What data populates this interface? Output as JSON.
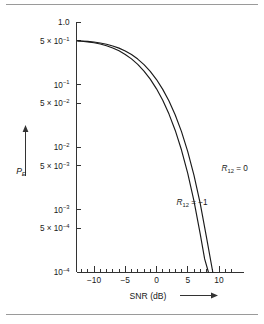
{
  "figure": {
    "has_top_rule": true,
    "has_bottom_rule": true,
    "background": "#ffffff",
    "ink_color": "#1a1a1a"
  },
  "chart_data": {
    "type": "line",
    "title": "",
    "subtitle": "",
    "xlabel": "SNR (dB)",
    "ylabel": "P_E",
    "ylabel_display": "P",
    "ylabel_subscript": "E",
    "xlabel_arrow": "→",
    "ylabel_arrow": "↑",
    "grid": false,
    "legend": "inline-annotations",
    "xscale": "linear",
    "yscale": "log",
    "xlim": [
      -12.8,
      14.0
    ],
    "ylim": [
      0.0001,
      1.0
    ],
    "xticks_major": [
      -10,
      -5,
      0,
      5,
      10
    ],
    "xticks_major_labels": [
      "-10",
      "-5",
      "0",
      "5",
      "10"
    ],
    "xticks_minor": [
      -12,
      -11,
      -9,
      -8,
      -7,
      -6,
      -4,
      -3,
      -2,
      -1,
      1,
      2,
      3,
      4,
      6,
      7,
      8,
      9,
      11,
      12
    ],
    "yticks": [
      1.0,
      0.5,
      0.1,
      0.05,
      0.01,
      0.005,
      0.001,
      0.0005,
      0.0001
    ],
    "ytick_labels": [
      {
        "mantissa": "1.0",
        "base": "",
        "exponent": "",
        "value": 1.0
      },
      {
        "mantissa": "5 × 10",
        "base": "10",
        "exponent": "-1",
        "value": 0.5
      },
      {
        "mantissa": "10",
        "base": "10",
        "exponent": "-1",
        "value": 0.1
      },
      {
        "mantissa": "5 × 10",
        "base": "10",
        "exponent": "-2",
        "value": 0.05
      },
      {
        "mantissa": "10",
        "base": "10",
        "exponent": "-2",
        "value": 0.01
      },
      {
        "mantissa": "5 × 10",
        "base": "10",
        "exponent": "-3",
        "value": 0.005
      },
      {
        "mantissa": "10",
        "base": "10",
        "exponent": "-3",
        "value": 0.001
      },
      {
        "mantissa": "5 × 10",
        "base": "10",
        "exponent": "-4",
        "value": 0.0005
      },
      {
        "mantissa": "10",
        "base": "10",
        "exponent": "-4",
        "value": 0.0001
      }
    ],
    "series": [
      {
        "name": "R_12 = 0",
        "label_main": "R",
        "label_sub": "12",
        "label_rest": " = 0",
        "label_x": 10.4,
        "label_y": 0.0042,
        "points": [
          [
            -12.6,
            0.5
          ],
          [
            -12.0,
            0.497
          ],
          [
            -11.0,
            0.49
          ],
          [
            -10.0,
            0.478
          ],
          [
            -9.0,
            0.462
          ],
          [
            -8.0,
            0.441
          ],
          [
            -7.0,
            0.414
          ],
          [
            -6.0,
            0.382
          ],
          [
            -5.0,
            0.344
          ],
          [
            -4.0,
            0.301
          ],
          [
            -3.0,
            0.255
          ],
          [
            -2.0,
            0.208
          ],
          [
            -1.0,
            0.162
          ],
          [
            0.0,
            0.12
          ],
          [
            1.0,
            0.0835
          ],
          [
            2.0,
            0.0545
          ],
          [
            3.0,
            0.0325
          ],
          [
            4.0,
            0.0176
          ],
          [
            5.0,
            0.00845
          ],
          [
            6.0,
            0.00352
          ],
          [
            7.0,
            0.00124
          ],
          [
            8.0,
            0.000357
          ],
          [
            9.0,
            8.15e-05
          ],
          [
            9.6,
            3.18e-05
          ],
          [
            10.2,
            1.18e-05
          ]
        ]
      },
      {
        "name": "R_12 = -1",
        "label_main": "R",
        "label_sub": "12",
        "label_rest": " = −1",
        "label_x": 3.2,
        "label_y": 0.0012,
        "points": [
          [
            -12.6,
            0.497
          ],
          [
            -12.0,
            0.492
          ],
          [
            -11.0,
            0.482
          ],
          [
            -10.0,
            0.466
          ],
          [
            -9.0,
            0.444
          ],
          [
            -8.0,
            0.417
          ],
          [
            -7.0,
            0.384
          ],
          [
            -6.0,
            0.346
          ],
          [
            -5.0,
            0.303
          ],
          [
            -4.0,
            0.257
          ],
          [
            -3.0,
            0.21
          ],
          [
            -2.0,
            0.164
          ],
          [
            -1.0,
            0.122
          ],
          [
            0.0,
            0.0853
          ],
          [
            1.0,
            0.0558
          ],
          [
            2.0,
            0.0336
          ],
          [
            3.0,
            0.0184
          ],
          [
            4.0,
            0.00894
          ],
          [
            5.0,
            0.00378
          ],
          [
            6.0,
            0.00136
          ],
          [
            7.0,
            0.000403
          ],
          [
            7.7,
            0.000162
          ],
          [
            8.3,
            5.94e-05
          ]
        ]
      }
    ]
  }
}
